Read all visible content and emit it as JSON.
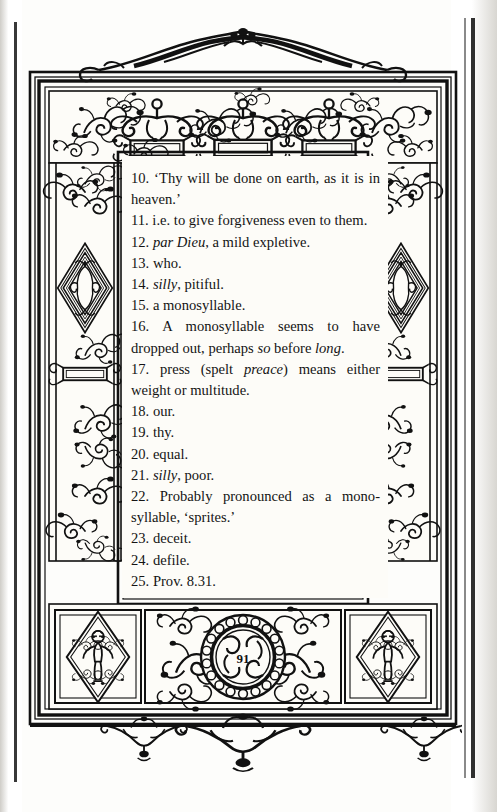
{
  "document": {
    "kind": "scanned-book-page",
    "page_number": "91",
    "paper_color": "#fdfcf8",
    "ink_color": "#141414",
    "border_style": "renaissance-engraved-ornamental-frame"
  },
  "notes": [
    {
      "n": "10.",
      "text": "‘Thy will be done on earth, as it is in heaven.’"
    },
    {
      "n": "11.",
      "text": "i.e. to give forgiveness even to them."
    },
    {
      "n": "12.",
      "text": "par Dieu, a mild expletive.",
      "italic_words": [
        "par Dieu"
      ]
    },
    {
      "n": "13.",
      "text": "who."
    },
    {
      "n": "14.",
      "text": "silly, pitiful.",
      "italic_words": [
        "silly"
      ]
    },
    {
      "n": "15.",
      "text": "a monosyllable."
    },
    {
      "n": "16.",
      "text": "A monosyllable seems to have dropped out, perhaps so before long.",
      "italic_words": [
        "so",
        "long"
      ]
    },
    {
      "n": "17.",
      "text": "press (spelt preace) means either weight or multitude.",
      "italic_words": [
        "preace"
      ]
    },
    {
      "n": "18.",
      "text": "our."
    },
    {
      "n": "19.",
      "text": "thy."
    },
    {
      "n": "20.",
      "text": "equal."
    },
    {
      "n": "21.",
      "text": "silly, poor.",
      "italic_words": [
        "silly"
      ]
    },
    {
      "n": "22.",
      "text": "Probably pronounced as a mono-syllable, ‘sprites.’"
    },
    {
      "n": "23.",
      "text": "deceit."
    },
    {
      "n": "24.",
      "text": "defile."
    },
    {
      "n": "25.",
      "text": "Prov. 8.31."
    }
  ],
  "notes_html": [
    "10. ‘Thy will be done on earth, as it is in heaven.’",
    "11. i.e. to give forgiveness even to them.",
    "12. <em>par Dieu</em>, a mild expletive.",
    "13. who.",
    "14. <em>silly</em>, pitiful.",
    "15. a monosyllable.",
    "16. A monosyllable seems to have dropped out, perhaps <em>so</em> before <em>long</em>.",
    "17. press (spelt <em>preace</em>) means either weight or multitude.",
    "18. our.",
    "19. thy.",
    "20. equal.",
    "21. <em>silly</em>, poor.",
    "22. Probably pronounced as a mono-syllable, ‘sprites.’",
    "23. deceit.",
    "24. defile.",
    "25. Prov. 8.31."
  ],
  "ornament": {
    "top_crest": "foliate-scroll-crest",
    "bottom_pendants": "three-pendant-foliate-drops",
    "side_panels": "nested-diamond-lozenge-with-acanthus",
    "corner_panels": "diamond-with-putto-figure",
    "tablets": "blank-rectangular-cartouche",
    "roundel": "beaded-medallion-with-page-number"
  }
}
